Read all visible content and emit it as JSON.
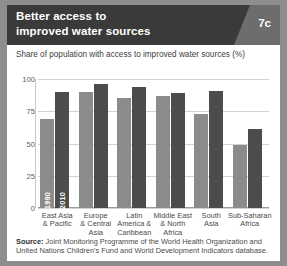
{
  "header": {
    "title_line1": "Better access to",
    "title_line2": "improved water sources",
    "badge": "7c",
    "bg_color": "#3a3a3a",
    "wedge_color": "#6d6d6d"
  },
  "subtitle": "Share of population with access to improved water sources (%)",
  "source": {
    "label": "Source:",
    "text": "Joint Monitoring Programme of the World Health Organization and United Nations Children's Fund and World Development Indicators database."
  },
  "chart_data": {
    "type": "bar",
    "title": "Better access to improved water sources",
    "subtitle": "Share of population with access to improved water sources (%)",
    "xlabel": "",
    "ylabel": "",
    "ylim": [
      0,
      100
    ],
    "yticks": [
      0,
      25,
      50,
      75,
      100
    ],
    "ytick_labels": [
      "0",
      "25",
      "50",
      "75",
      "100"
    ],
    "grid": true,
    "legend_position": "in-bar-rotated-labels",
    "categories": [
      "East Asia & Pacific",
      "Europe & Central Asia",
      "Latin America & Caribbean",
      "Middle East & North Africa",
      "South Asia",
      "Sub-Saharan Africa"
    ],
    "category_lines": [
      [
        "East Asia",
        "& Pacific"
      ],
      [
        "Europe",
        "& Central",
        "Asia"
      ],
      [
        "Latin",
        "America &",
        "Caribbean"
      ],
      [
        "Middle East",
        "& North",
        "Africa"
      ],
      [
        "South",
        "Asia"
      ],
      [
        "Sub-Saharan",
        "Africa"
      ]
    ],
    "series": [
      {
        "name": "1990",
        "color": "#8b8b8b",
        "values": [
          69,
          90,
          85,
          87,
          73,
          49
        ]
      },
      {
        "name": "2010",
        "color": "#4c4c4c",
        "values": [
          90,
          96,
          94,
          89,
          91,
          61
        ]
      }
    ],
    "annotations": [
      {
        "text": "1990",
        "on": "first-group-light-bar"
      },
      {
        "text": "2010",
        "on": "first-group-dark-bar"
      }
    ]
  }
}
